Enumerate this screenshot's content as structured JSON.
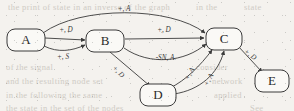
{
  "figure": {
    "width": 294,
    "height": 111,
    "background_color": "#f4f2ee",
    "ink_color": "#3a3a3a",
    "node_fill_color": "#faf9f6"
  },
  "graph": {
    "type": "directed-graph",
    "node_shape": "rounded-rectangle",
    "nodes": [
      {
        "id": "A",
        "label": "A",
        "cx": 26,
        "cy": 40,
        "rx": 19,
        "ry": 11
      },
      {
        "id": "B",
        "label": "B",
        "cx": 105,
        "cy": 41,
        "rx": 19,
        "ry": 11
      },
      {
        "id": "C",
        "label": "C",
        "cx": 224,
        "cy": 39,
        "rx": 18,
        "ry": 11
      },
      {
        "id": "D",
        "label": "D",
        "cx": 158,
        "cy": 95,
        "rx": 18,
        "ry": 11
      },
      {
        "id": "E",
        "label": "E",
        "cx": 272,
        "cy": 81,
        "rx": 17,
        "ry": 11
      }
    ],
    "edges": [
      {
        "from": "A",
        "to": "C",
        "label": "+, A",
        "label_x": 124,
        "label_y": 9,
        "rotation": 0
      },
      {
        "from": "A",
        "to": "B",
        "label": "+, D",
        "label_x": 66,
        "label_y": 30,
        "rotation": 0
      },
      {
        "from": "A",
        "to": "B",
        "label": "+, S",
        "label_x": 63,
        "label_y": 57,
        "rotation": 0
      },
      {
        "from": "B",
        "to": "C",
        "label": "+, D",
        "label_x": 164,
        "label_y": 30,
        "rotation": 0
      },
      {
        "from": "B",
        "to": "C",
        "label": "-SN, A",
        "label_x": 165,
        "label_y": 58,
        "rotation": 0
      },
      {
        "from": "B",
        "to": "D",
        "label": "+, D",
        "label_x": 118,
        "label_y": 72,
        "rotation": 46
      },
      {
        "from": "D",
        "to": "C",
        "label": "+, A",
        "label_x": 190,
        "label_y": 74,
        "rotation": -62
      },
      {
        "from": "D",
        "to": "C",
        "label": "+, A",
        "label_x": 209,
        "label_y": 80,
        "rotation": -62
      },
      {
        "from": "C",
        "to": "E",
        "label": "+, D",
        "label_x": 250,
        "label_y": 55,
        "rotation": 36
      }
    ]
  },
  "background_text": {
    "note": "faint show-through text from the reverse page of the scan",
    "lines": [
      {
        "text": "the print of state in an inverse of the graph",
        "x": 8,
        "y": 2
      },
      {
        "text": "in the",
        "x": 196,
        "y": 2
      },
      {
        "text": "state",
        "x": 244,
        "y": 2
      },
      {
        "text": "of the signal",
        "x": 6,
        "y": 62
      },
      {
        "text": "consider",
        "x": 196,
        "y": 62
      },
      {
        "text": "and the resulting node set",
        "x": 6,
        "y": 76
      },
      {
        "text": "network",
        "x": 212,
        "y": 76
      },
      {
        "text": "in the following the same",
        "x": 6,
        "y": 90
      },
      {
        "text": "applied",
        "x": 214,
        "y": 90
      },
      {
        "text": "the state in the set of the nodes",
        "x": 6,
        "y": 103
      },
      {
        "text": "See",
        "x": 250,
        "y": 103
      }
    ]
  }
}
